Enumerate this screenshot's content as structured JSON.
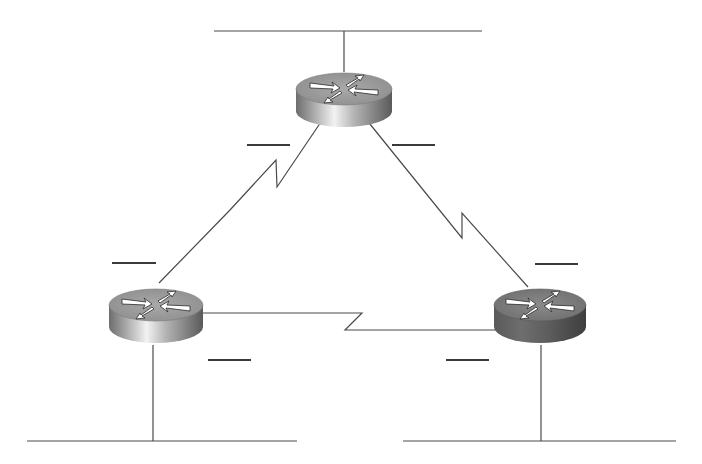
{
  "diagram": {
    "type": "network-topology",
    "background": "#ffffff",
    "line_color": "#4a4a4a",
    "routers": [
      {
        "id": "router-top",
        "cx": 344,
        "cy": 90,
        "style": "light"
      },
      {
        "id": "router-left",
        "cx": 156,
        "cy": 308,
        "style": "light"
      },
      {
        "id": "router-right",
        "cx": 540,
        "cy": 308,
        "style": "dark"
      }
    ],
    "lan_segments": [
      {
        "id": "lan-top",
        "x1": 214,
        "x2": 482,
        "y": 31,
        "drop_x": 344
      },
      {
        "id": "lan-bottom-left",
        "x1": 27,
        "x2": 297,
        "y": 441,
        "drop_x": 153
      },
      {
        "id": "lan-bottom-right",
        "x1": 403,
        "x2": 676,
        "y": 441,
        "drop_x": 541
      }
    ],
    "serial_links": [
      {
        "id": "link-top-left",
        "from": "router-top",
        "to": "router-left"
      },
      {
        "id": "link-top-right",
        "from": "router-top",
        "to": "router-right"
      },
      {
        "id": "link-left-right",
        "from": "router-left",
        "to": "router-right"
      }
    ],
    "blank_labels": [
      {
        "id": "blank-top-left",
        "x1": 247,
        "x2": 290,
        "y": 145
      },
      {
        "id": "blank-top-right",
        "x1": 392,
        "x2": 435,
        "y": 145
      },
      {
        "id": "blank-left-upper",
        "x1": 112,
        "x2": 156,
        "y": 263
      },
      {
        "id": "blank-right-upper",
        "x1": 535,
        "x2": 578,
        "y": 264
      },
      {
        "id": "blank-left-lower",
        "x1": 208,
        "x2": 251,
        "y": 360
      },
      {
        "id": "blank-right-lower",
        "x1": 446,
        "x2": 489,
        "y": 360
      }
    ]
  }
}
